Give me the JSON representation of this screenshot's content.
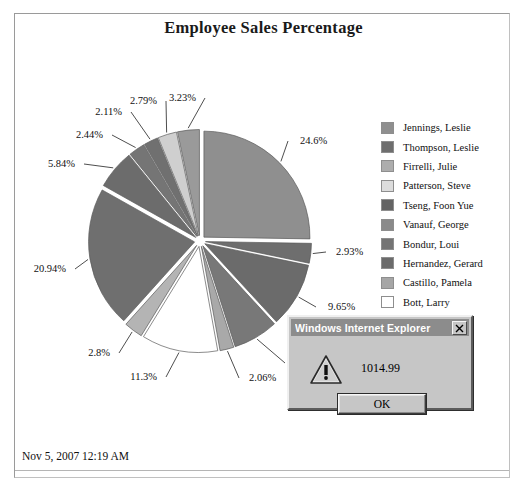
{
  "report": {
    "title": "Employee Sales Percentage",
    "timestamp": "Nov 5, 2007 12:19 AM"
  },
  "chart_data": {
    "type": "pie",
    "title": "Employee Sales Percentage",
    "legend_position": "right",
    "exploded": true,
    "categories": [
      "Jennings, Leslie",
      "Thompson, Leslie",
      "Firrelli, Julie",
      "Patterson, Steve",
      "Tseng, Foon Yue",
      "Vanauf, George",
      "Bondur, Loui",
      "Hernandez, Gerard",
      "Castillo, Pamela",
      "Bott, Larry",
      "Jones, Barry"
    ],
    "values": [
      24.6,
      2.93,
      9.65,
      6.69,
      2.06,
      11.3,
      2.8,
      20.94,
      5.84,
      2.44,
      2.11
    ],
    "labels": [
      "24.6%",
      "2.93%",
      "9.65%",
      "6.69%",
      "2.06%",
      "11.3%",
      "2.8%",
      "20.94%",
      "5.84%",
      "2.44%",
      "2.11%",
      "2.79%",
      "3.23%"
    ],
    "colors": [
      "#8f8f8f",
      "#6e6e6e",
      "#adadad",
      "#d8d8d8",
      "#666666",
      "#8a8a8a",
      "#777777",
      "#6b6b6b",
      "#a6a6a6",
      "#ffffff",
      "#9c9c9c"
    ],
    "slices": [
      {
        "label": "24.6%",
        "value": 24.6,
        "color": "#8f8f8f"
      },
      {
        "label": "2.93%",
        "value": 2.93,
        "color": "#6e6e6e"
      },
      {
        "label": "9.65%",
        "value": 9.65,
        "color": "#6b6b6b"
      },
      {
        "label": "6.69%",
        "value": 6.69,
        "color": "#787878"
      },
      {
        "label": "2.06%",
        "value": 2.06,
        "color": "#a9a9a9"
      },
      {
        "label": "11.3%",
        "value": 11.3,
        "color": "#ffffff"
      },
      {
        "label": "2.8%",
        "value": 2.8,
        "color": "#b4b4b4"
      },
      {
        "label": "20.94%",
        "value": 20.94,
        "color": "#6f6f6f"
      },
      {
        "label": "5.84%",
        "value": 5.84,
        "color": "#6c6c6c"
      },
      {
        "label": "2.44%",
        "value": 2.44,
        "color": "#757575"
      },
      {
        "label": "2.11%",
        "value": 2.11,
        "color": "#707070"
      },
      {
        "label": "2.79%",
        "value": 2.79,
        "color": "#cfcfcf"
      },
      {
        "label": "3.23%",
        "value": 3.23,
        "color": "#9a9a9a"
      }
    ]
  },
  "legend": {
    "items": [
      {
        "label": "Jennings, Leslie",
        "color": "#8f8f8f"
      },
      {
        "label": "Thompson, Leslie",
        "color": "#6e6e6e"
      },
      {
        "label": "Firrelli, Julie",
        "color": "#adadad"
      },
      {
        "label": "Patterson, Steve",
        "color": "#dcdcdc"
      },
      {
        "label": "Tseng, Foon Yue",
        "color": "#646464"
      },
      {
        "label": "Vanauf, George",
        "color": "#8a8a8a"
      },
      {
        "label": "Bondur, Loui",
        "color": "#747474"
      },
      {
        "label": "Hernandez, Gerard",
        "color": "#6b6b6b"
      },
      {
        "label": "Castillo, Pamela",
        "color": "#a6a6a6"
      },
      {
        "label": "Bott, Larry",
        "color": "#ffffff"
      },
      {
        "label": "",
        "color": "#9c9c9c"
      }
    ]
  },
  "dialog": {
    "title": "Windows Internet Explorer",
    "message": "1014.99",
    "ok_label": "OK",
    "close_label": "X",
    "icon": "warning-triangle-icon"
  }
}
